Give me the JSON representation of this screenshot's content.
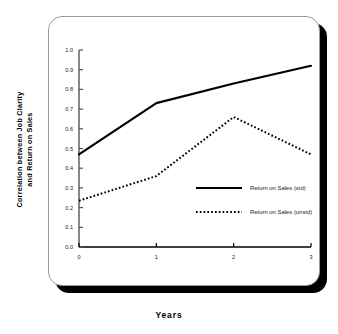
{
  "chart_data": {
    "type": "line",
    "title": "",
    "xlabel": "Years",
    "ylabel": "Correlation between Job Clarity\nand Return on Sales",
    "x": [
      0,
      1,
      2,
      3
    ],
    "xticklabels": [
      "0",
      "1",
      "2",
      "3"
    ],
    "yticklabels": [
      "0.0",
      "0.1",
      "0.2",
      "0.3",
      "0.4",
      "0.5",
      "0.6",
      "0.7",
      "0.8",
      "0.9",
      "1.0"
    ],
    "ylim": [
      0.0,
      1.0
    ],
    "xlim": [
      0,
      3
    ],
    "grid": false,
    "legend_position": "center-right",
    "series": [
      {
        "name": "Return on Sales (std)",
        "style": "solid",
        "color": "#000000",
        "values": [
          0.47,
          0.73,
          0.83,
          0.92
        ]
      },
      {
        "name": "Return on Sales (unstd)",
        "style": "dotted",
        "color": "#000000",
        "values": [
          0.235,
          0.36,
          0.66,
          0.47
        ]
      }
    ]
  },
  "figure": {
    "x_axis_title": "Years",
    "y_axis_title": "Correlation between Job Clarity\nand Return on Sales",
    "yticks": [
      "1.0",
      "0.9",
      "0.8",
      "0.7",
      "0.6",
      "0.5",
      "0.4",
      "0.3",
      "0.2",
      "0.1",
      "0.0"
    ],
    "xticks": [
      "0",
      "1",
      "2",
      "3"
    ],
    "legend": [
      {
        "label": "Return on Sales (std)",
        "style": "solid"
      },
      {
        "label": "Return on Sales (unstd)",
        "style": "dotted"
      }
    ]
  }
}
